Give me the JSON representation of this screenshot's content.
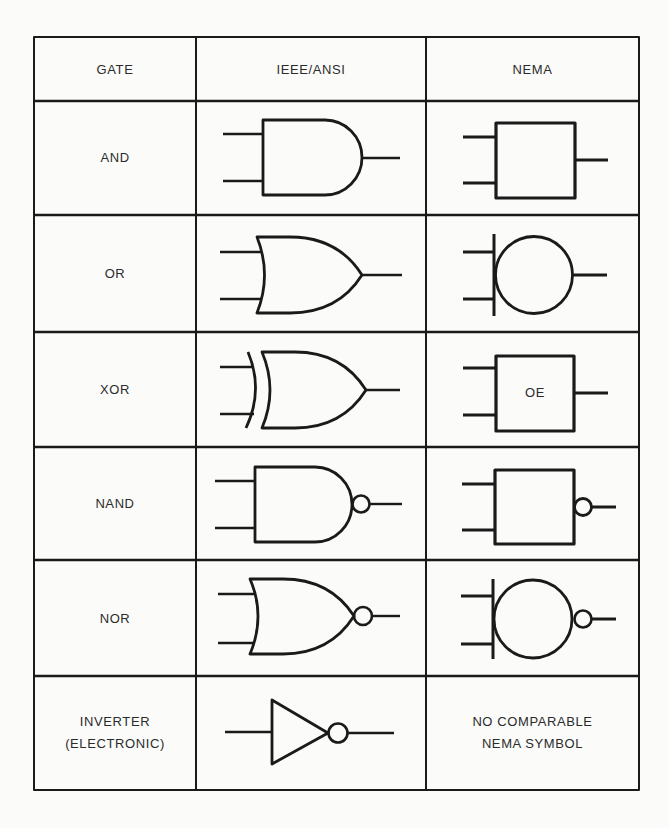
{
  "table": {
    "headers": [
      "GATE",
      "IEEE/ANSI",
      "NEMA"
    ],
    "rows": [
      {
        "gate": "AND",
        "ieee_symbol": "and-gate-distinctive-shape",
        "nema_symbol": "and-gate-nema-square",
        "nema_label": ""
      },
      {
        "gate": "OR",
        "ieee_symbol": "or-gate-distinctive-shape",
        "nema_symbol": "or-gate-nema-circle",
        "nema_label": ""
      },
      {
        "gate": "XOR",
        "ieee_symbol": "xor-gate-distinctive-shape",
        "nema_symbol": "xor-gate-nema-square",
        "nema_label": "OE"
      },
      {
        "gate": "NAND",
        "ieee_symbol": "nand-gate-distinctive-shape",
        "nema_symbol": "nand-gate-nema-square-bubble",
        "nema_label": ""
      },
      {
        "gate": "NOR",
        "ieee_symbol": "nor-gate-distinctive-shape",
        "nema_symbol": "nor-gate-nema-circle-bubble",
        "nema_label": ""
      },
      {
        "gate": "INVERTER",
        "gate_line2": "(ELECTRONIC)",
        "ieee_symbol": "inverter-triangle-bubble",
        "nema_symbol": "none",
        "nema_text_line1": "NO COMPARABLE",
        "nema_text_line2": "NEMA SYMBOL"
      }
    ]
  },
  "colors": {
    "background": "#fbfbfa",
    "line": "#1a1a1a",
    "text": "#2b2b2b"
  }
}
